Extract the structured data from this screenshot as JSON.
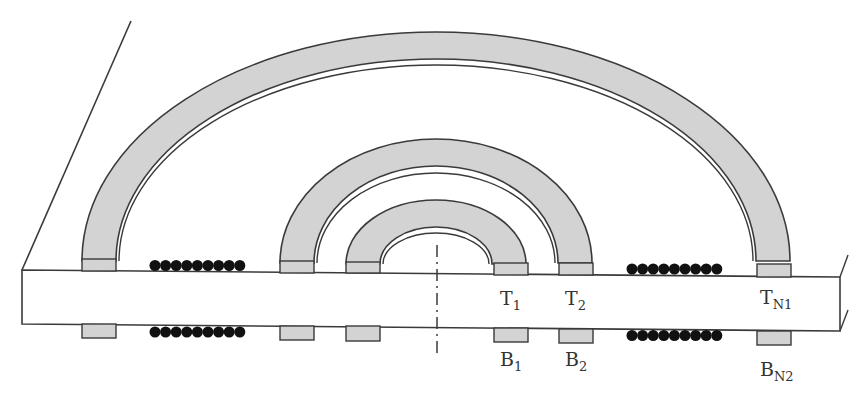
{
  "diagram": {
    "colors": {
      "stroke": "#3a3a3a",
      "coil_fill": "#d3d3d3",
      "slab_fill": "#ffffff",
      "dot_fill": "#111111"
    },
    "labels": {
      "t1": {
        "main": "T",
        "sub": "1"
      },
      "t2": {
        "main": "T",
        "sub": "2"
      },
      "tn1": {
        "main": "T",
        "sub": "N1"
      },
      "b1": {
        "main": "B",
        "sub": "1"
      },
      "b2": {
        "main": "B",
        "sub": "2"
      },
      "bn2": {
        "main": "B",
        "sub": "N2"
      }
    },
    "arches": [
      {
        "name": "outer",
        "cx": 436,
        "base_y": 261,
        "outer_rx": 354,
        "outer_ry": 229,
        "inner_rx": 320,
        "inner_ry": 202,
        "line_ry": 196
      },
      {
        "name": "middle",
        "cx": 436,
        "base_y": 263,
        "outer_rx": 156,
        "outer_ry": 124,
        "inner_rx": 122,
        "inner_ry": 97,
        "line_ry": 90
      },
      {
        "name": "inner",
        "cx": 436,
        "base_y": 264,
        "outer_rx": 90,
        "outer_ry": 64,
        "inner_rx": 56,
        "inner_ry": 37,
        "line_ry": 31
      }
    ],
    "dot_rows": {
      "count_per_row": 9,
      "rows": 4
    }
  }
}
